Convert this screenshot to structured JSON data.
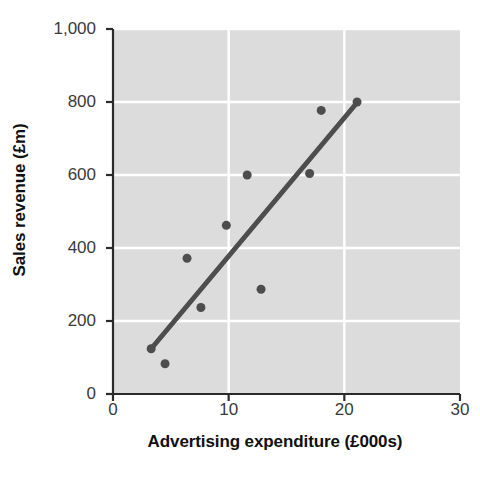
{
  "chart_data": {
    "type": "scatter",
    "title": "",
    "xlabel": "Advertising expenditure (£000s)",
    "ylabel": "Sales revenue (£m)",
    "xlim": [
      0,
      30
    ],
    "ylim": [
      0,
      1000
    ],
    "xticks": [
      0,
      10,
      20,
      30
    ],
    "xtick_labels": [
      "0",
      "10",
      "20",
      "30"
    ],
    "yticks": [
      0,
      200,
      400,
      600,
      800,
      1000
    ],
    "ytick_labels": [
      "0",
      "200",
      "400",
      "600",
      "800",
      "1,000"
    ],
    "grid": true,
    "grid_color": "#ffffff",
    "plot_background": "#dcdcdc",
    "legend": null,
    "series": [
      {
        "name": "Observations",
        "type": "scatter",
        "marker_color": "#4d4d4d",
        "marker_size": 9,
        "points": [
          {
            "x": 3.3,
            "y": 124
          },
          {
            "x": 4.5,
            "y": 83
          },
          {
            "x": 6.4,
            "y": 372
          },
          {
            "x": 7.6,
            "y": 237
          },
          {
            "x": 9.8,
            "y": 462
          },
          {
            "x": 11.6,
            "y": 600
          },
          {
            "x": 12.8,
            "y": 287
          },
          {
            "x": 17.0,
            "y": 604
          },
          {
            "x": 18.0,
            "y": 777
          },
          {
            "x": 21.1,
            "y": 800
          }
        ]
      },
      {
        "name": "Line of best fit",
        "type": "line",
        "line_color": "#4d4d4d",
        "line_width": 5,
        "points": [
          {
            "x": 3.3,
            "y": 124
          },
          {
            "x": 21.2,
            "y": 802
          }
        ]
      }
    ]
  }
}
